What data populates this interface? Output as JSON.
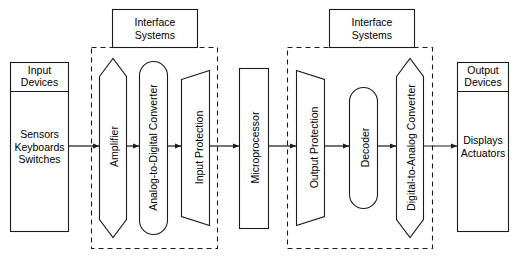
{
  "diagram": {
    "line_color": "#1a1a1a",
    "fill_color": "#ffffff",
    "background": "#ffffff",
    "groups": [
      {
        "id": "interface-systems-input",
        "label": "Interface\nSystems",
        "style": "dashed"
      },
      {
        "id": "interface-systems-output",
        "label": "Interface\nSystems",
        "style": "dashed"
      }
    ],
    "blocks": [
      {
        "id": "input-devices",
        "shape": "rectangle-with-header",
        "header": "Input\nDevices",
        "body": "Sensors\nKeyboards\nSwitches",
        "orientation": "horizontal"
      },
      {
        "id": "amplifier",
        "shape": "hexagon",
        "label": "Amplifier",
        "orientation": "vertical"
      },
      {
        "id": "analog-to-digital-converter",
        "shape": "stadium",
        "label": "Analog-to-Digital Converter",
        "orientation": "vertical"
      },
      {
        "id": "input-protection",
        "shape": "trapezoid-expanding",
        "label": "Input Protection",
        "orientation": "vertical"
      },
      {
        "id": "microprocessor",
        "shape": "rectangle",
        "label": "Microprocessor",
        "orientation": "vertical"
      },
      {
        "id": "output-protection",
        "shape": "trapezoid-contracting",
        "label": "Output Protection",
        "orientation": "vertical"
      },
      {
        "id": "decoder",
        "shape": "stadium",
        "label": "Decoder",
        "orientation": "vertical"
      },
      {
        "id": "digital-to-analog-converter",
        "shape": "hexagon",
        "label": "Digital-to-Analog Converter",
        "orientation": "vertical"
      },
      {
        "id": "output-devices",
        "shape": "rectangle-with-header",
        "header": "Output\nDevices",
        "body": "Displays\nActuators",
        "orientation": "horizontal"
      }
    ],
    "connectors": [
      {
        "from": "input-devices",
        "to": "amplifier",
        "type": "arrow"
      },
      {
        "from": "amplifier",
        "to": "analog-to-digital-converter",
        "type": "arrow"
      },
      {
        "from": "analog-to-digital-converter",
        "to": "input-protection",
        "type": "arrow"
      },
      {
        "from": "input-protection",
        "to": "microprocessor",
        "type": "arrow"
      },
      {
        "from": "microprocessor",
        "to": "output-protection",
        "type": "arrow"
      },
      {
        "from": "output-protection",
        "to": "decoder",
        "type": "arrow"
      },
      {
        "from": "decoder",
        "to": "digital-to-analog-converter",
        "type": "arrow"
      },
      {
        "from": "digital-to-analog-converter",
        "to": "output-devices",
        "type": "arrow"
      }
    ]
  }
}
